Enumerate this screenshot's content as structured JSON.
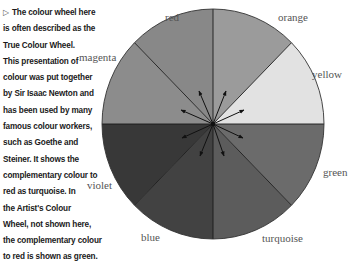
{
  "caption": {
    "marker": "▷",
    "lines": [
      "The colour wheel here",
      "is often described as the",
      "True Colour Wheel.",
      "This presentation of",
      "colour was put together",
      "by Sir Isaac Newton and",
      "has been used by many",
      "famous colour workers,",
      "such as Goethe and",
      "Steiner. It shows the",
      "complementary colour to",
      "red as turquoise. In",
      "the Artist's Colour",
      "Wheel, not shown here,",
      "the complementary colour",
      "to red is shown as green."
    ]
  },
  "wheel": {
    "center": [
      213,
      124
    ],
    "rx": 111,
    "ry": 115,
    "sectors": [
      {
        "name": "orange",
        "label": "orange",
        "shade": "#9b9b9b"
      },
      {
        "name": "yellow",
        "label": "yellow",
        "shade": "#e2e2e2"
      },
      {
        "name": "green",
        "label": "green",
        "shade": "#6b6b6b"
      },
      {
        "name": "turquoise",
        "label": "turquoise",
        "shade": "#5c5c5c"
      },
      {
        "name": "blue",
        "label": "blue",
        "shade": "#424242"
      },
      {
        "name": "violet",
        "label": "violet",
        "shade": "#383838"
      },
      {
        "name": "magenta",
        "label": "magenta",
        "shade": "#8c8c8c"
      },
      {
        "name": "red",
        "label": "red",
        "shade": "#888888"
      }
    ],
    "labels": {
      "red": "red",
      "orange": "orange",
      "yellow": "yellow",
      "green": "green",
      "turquoise": "turquoise",
      "blue": "blue",
      "violet": "violet",
      "magenta": "magenta"
    }
  }
}
